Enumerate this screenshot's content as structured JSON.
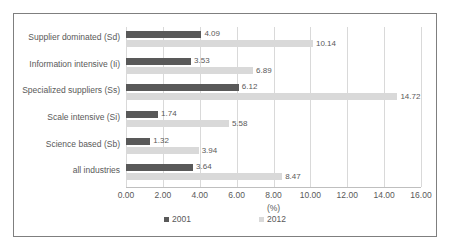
{
  "chart_data": {
    "type": "bar",
    "orientation": "horizontal",
    "title": "",
    "xlabel": "(%)",
    "ylabel": "",
    "xlim": [
      0,
      16
    ],
    "xticks": [
      "0.00",
      "2.00",
      "4.00",
      "6.00",
      "8.00",
      "10.00",
      "12.00",
      "14.00",
      "16.00"
    ],
    "grid": true,
    "legend_position": "bottom",
    "categories": [
      "Supplier dominated (Sd)",
      "Information intensive (Ii)",
      "Specialized suppliers (Ss)",
      "Scale intensive (Si)",
      "Science based (Sb)",
      "all industries"
    ],
    "series": [
      {
        "name": "2001",
        "color": "#595959",
        "values": [
          4.09,
          3.53,
          6.12,
          1.74,
          1.32,
          3.64
        ],
        "labels": [
          "4.09",
          "3.53",
          "6.12",
          "1.74",
          "1.32",
          "3.64"
        ]
      },
      {
        "name": "2012",
        "color": "#d9d9d9",
        "values": [
          10.14,
          6.89,
          14.72,
          5.58,
          3.94,
          8.47
        ],
        "labels": [
          "10.14",
          "6.89",
          "14.72",
          "5.58",
          "3.94",
          "8.47"
        ]
      }
    ]
  }
}
